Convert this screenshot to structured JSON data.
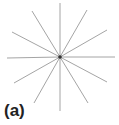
{
  "figure": {
    "label": "(a)",
    "center": [
      60,
      57
    ],
    "line_color": "#9a9a9a",
    "center_dot_color": "#333333",
    "rays": [
      {
        "x": 60,
        "y": 3
      },
      {
        "x": 87,
        "y": 10
      },
      {
        "x": 107,
        "y": 30
      },
      {
        "x": 115,
        "y": 57
      },
      {
        "x": 107,
        "y": 82
      },
      {
        "x": 88,
        "y": 103
      },
      {
        "x": 60,
        "y": 111
      },
      {
        "x": 34,
        "y": 103
      },
      {
        "x": 14,
        "y": 83
      },
      {
        "x": 7,
        "y": 58
      },
      {
        "x": 12,
        "y": 32
      },
      {
        "x": 32,
        "y": 11
      }
    ]
  }
}
